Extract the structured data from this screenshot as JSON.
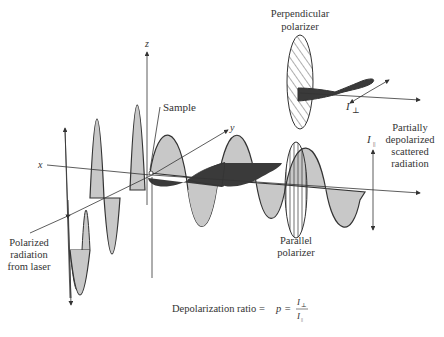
{
  "diagram": {
    "axes": {
      "x": "x",
      "y": "y",
      "z": "z"
    },
    "labels": {
      "sample": "Sample",
      "perpendicular_polarizer_line1": "Perpendicular",
      "perpendicular_polarizer_line2": "polarizer",
      "parallel_polarizer_line1": "Parallel",
      "parallel_polarizer_line2": "polarizer",
      "partially_line1": "Partially",
      "partially_line2": "depolarized",
      "partially_line3": "scattered",
      "partially_line4": "radiation",
      "laser_line1": "Polarized",
      "laser_line2": "radiation",
      "laser_line3": "from laser",
      "i_perp": "I",
      "i_perp_sub": "⊥",
      "i_par": "I",
      "i_par_sub": "||"
    },
    "equation": {
      "prefix": "Depolarization ratio = ",
      "symbol": "p",
      "equals": " = ",
      "numerator": "I",
      "numerator_sub": "⊥",
      "denominator": "I",
      "denominator_sub": "||"
    },
    "colors": {
      "light_wave": "#c8c8c8",
      "dark_wave": "#3a3a3a",
      "line": "#333333"
    }
  }
}
